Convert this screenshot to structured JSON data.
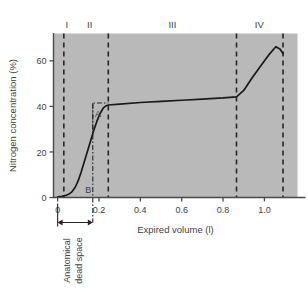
{
  "figure": {
    "background_color": "#ffffff",
    "plot_background_color": "#b9b9b9",
    "line_color": "#1a1a1a",
    "axis_color": "#4a4a4a",
    "text_color": "#3f3f3f"
  },
  "axes": {
    "ylabel": "Nitrogen concentration (%)",
    "xlabel": "Expired volume (l)",
    "yticks": [
      "0",
      "20",
      "40",
      "60"
    ],
    "ytick_values": [
      0,
      20,
      40,
      60
    ],
    "xticks": [
      "0",
      "0.2",
      "0.4",
      "0.6",
      "0.8",
      "1.0"
    ],
    "xtick_values": [
      0,
      0.2,
      0.4,
      0.6,
      0.8,
      1.0
    ],
    "xlim": [
      -0.02,
      1.16
    ],
    "ylim": [
      0,
      72
    ]
  },
  "phase_labels": [
    {
      "label": "I",
      "x": 0.045
    },
    {
      "label": "II",
      "x": 0.155
    },
    {
      "label": "III",
      "x": 0.555
    },
    {
      "label": "IV",
      "x": 0.975
    }
  ],
  "phase_dividers": [
    0.03,
    0.245,
    0.865,
    1.09
  ],
  "annotations": {
    "a_label": "A",
    "b_label": "B",
    "dead_space_label_line1": "Anatomical",
    "dead_space_label_line2": "dead space",
    "dead_space_from": 0.0,
    "dead_space_to": 0.17,
    "dashdot_line_x": 0.17,
    "a_box": {
      "x0": 0.17,
      "x1": 0.245,
      "y0": 29.5,
      "y1": 41.5
    }
  },
  "chart_data": {
    "type": "line",
    "title": "",
    "xlabel": "Expired volume (l)",
    "ylabel": "Nitrogen concentration (%)",
    "xlim": [
      -0.02,
      1.16
    ],
    "ylim": [
      0,
      72
    ],
    "grid": false,
    "legend": null,
    "series": [
      {
        "name": "Single-breath nitrogen washout",
        "x": [
          0.0,
          0.02,
          0.04,
          0.055,
          0.07,
          0.085,
          0.1,
          0.115,
          0.13,
          0.145,
          0.16,
          0.175,
          0.19,
          0.205,
          0.22,
          0.235,
          0.245,
          0.3,
          0.4,
          0.5,
          0.6,
          0.7,
          0.8,
          0.865,
          0.9,
          0.94,
          0.98,
          1.02,
          1.055,
          1.075,
          1.09
        ],
        "y": [
          0.3,
          0.5,
          0.9,
          1.5,
          2.6,
          4.5,
          7.5,
          11.5,
          16.0,
          20.5,
          25.0,
          29.5,
          33.5,
          36.8,
          39.2,
          40.3,
          40.6,
          41.0,
          41.7,
          42.2,
          42.7,
          43.2,
          43.7,
          44.2,
          47.0,
          52.5,
          57.5,
          62.5,
          66.2,
          65.2,
          63.2
        ]
      }
    ]
  }
}
